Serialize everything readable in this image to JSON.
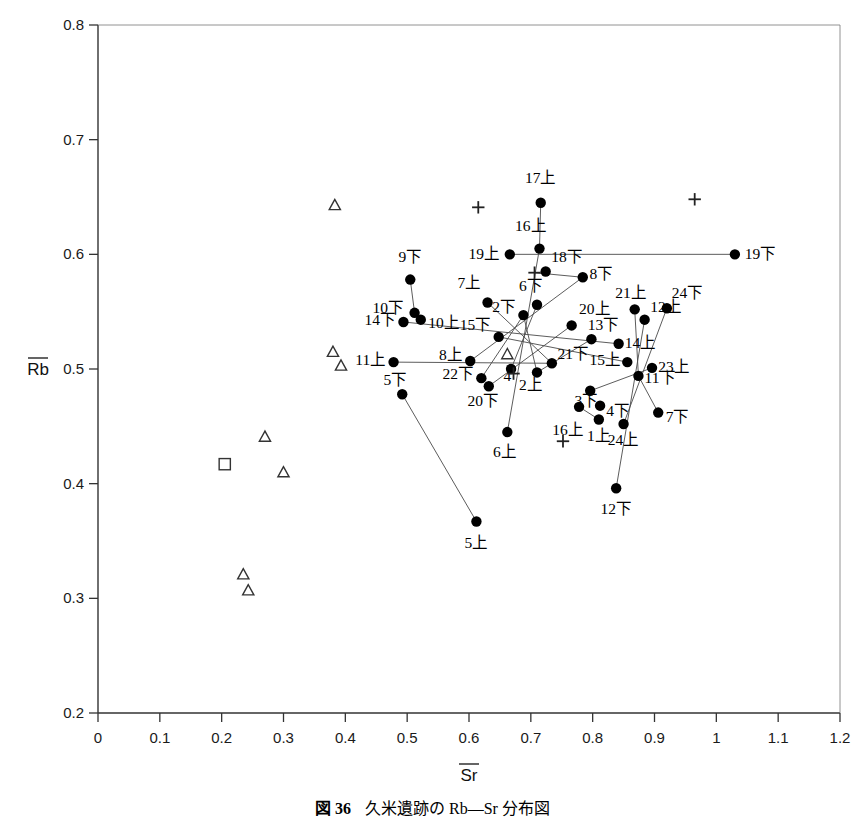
{
  "figure": {
    "caption_label": "図 36",
    "caption_text": "久米遺跡の Rb—Sr 分布図"
  },
  "chart_data": {
    "type": "scatter",
    "title": "",
    "xlabel": "Sr",
    "ylabel": "Rb",
    "xlabel_overline": true,
    "ylabel_overline": true,
    "xlim": [
      0,
      1.2
    ],
    "ylim": [
      0.2,
      0.8
    ],
    "xticks": [
      0,
      0.1,
      0.2,
      0.3,
      0.4,
      0.5,
      0.6,
      0.7,
      0.8,
      0.9,
      1,
      1.1,
      1.2
    ],
    "xticklabels": [
      "0",
      "0.1",
      "0.2",
      "0.3",
      "0.4",
      "0.5",
      "0.6",
      "0.7",
      "0.8",
      "0.9",
      "1",
      "1.1",
      "1.2"
    ],
    "yticks": [
      0.2,
      0.3,
      0.4,
      0.5,
      0.6,
      0.7,
      0.8
    ],
    "yticklabels": [
      "0.2",
      "0.3",
      "0.4",
      "0.5",
      "0.6",
      "0.7",
      "0.8"
    ],
    "grid": false,
    "legend": "none",
    "series": [
      {
        "name": "filled-circle-labeled",
        "marker": "circle",
        "color": "#000000",
        "points": [
          {
            "label": "17上",
            "x": 0.716,
            "y": 0.645,
            "lx": 0.716,
            "ly": 0.667,
            "anchor": "middle"
          },
          {
            "label": "16上",
            "x": 0.714,
            "y": 0.605,
            "lx": 0.7,
            "ly": 0.625,
            "anchor": "middle"
          },
          {
            "label": "19上",
            "x": 0.666,
            "y": 0.6,
            "lx": 0.65,
            "ly": 0.6,
            "anchor": "end"
          },
          {
            "label": "19下",
            "x": 1.03,
            "y": 0.6,
            "lx": 1.046,
            "ly": 0.6,
            "anchor": "start"
          },
          {
            "label": "18下",
            "x": 0.724,
            "y": 0.585,
            "lx": 0.733,
            "ly": 0.598,
            "anchor": "start"
          },
          {
            "label": "8下",
            "x": 0.784,
            "y": 0.58,
            "lx": 0.795,
            "ly": 0.583,
            "anchor": "start"
          },
          {
            "label": "9下",
            "x": 0.505,
            "y": 0.578,
            "lx": 0.505,
            "ly": 0.598,
            "anchor": "middle"
          },
          {
            "label": "7上",
            "x": 0.63,
            "y": 0.558,
            "lx": 0.62,
            "ly": 0.575,
            "anchor": "end"
          },
          {
            "label": "6下",
            "x": 0.71,
            "y": 0.556,
            "lx": 0.7,
            "ly": 0.572,
            "anchor": "middle"
          },
          {
            "label": "10下",
            "x": 0.512,
            "y": 0.549,
            "lx": 0.495,
            "ly": 0.553,
            "anchor": "end"
          },
          {
            "label": "10上",
            "x": 0.522,
            "y": 0.543,
            "lx": 0.534,
            "ly": 0.54,
            "anchor": "start"
          },
          {
            "label": "2下",
            "x": 0.688,
            "y": 0.547,
            "lx": 0.676,
            "ly": 0.554,
            "anchor": "end"
          },
          {
            "label": "21上",
            "x": 0.868,
            "y": 0.552,
            "lx": 0.862,
            "ly": 0.566,
            "anchor": "middle"
          },
          {
            "label": "12上",
            "x": 0.884,
            "y": 0.543,
            "lx": 0.893,
            "ly": 0.554,
            "anchor": "start"
          },
          {
            "label": "24下",
            "x": 0.92,
            "y": 0.553,
            "lx": 0.928,
            "ly": 0.566,
            "anchor": "start"
          },
          {
            "label": "14下",
            "x": 0.494,
            "y": 0.541,
            "lx": 0.482,
            "ly": 0.543,
            "anchor": "end"
          },
          {
            "label": "20上",
            "x": 0.766,
            "y": 0.538,
            "lx": 0.778,
            "ly": 0.552,
            "anchor": "start"
          },
          {
            "label": "15下",
            "x": 0.648,
            "y": 0.528,
            "lx": 0.636,
            "ly": 0.538,
            "anchor": "end"
          },
          {
            "label": "13下",
            "x": 0.798,
            "y": 0.526,
            "lx": 0.792,
            "ly": 0.538,
            "anchor": "start"
          },
          {
            "label": "14上",
            "x": 0.842,
            "y": 0.522,
            "lx": 0.852,
            "ly": 0.523,
            "anchor": "start"
          },
          {
            "label": "11上",
            "x": 0.478,
            "y": 0.506,
            "lx": 0.466,
            "ly": 0.508,
            "anchor": "end"
          },
          {
            "label": "8上",
            "x": 0.602,
            "y": 0.507,
            "lx": 0.59,
            "ly": 0.512,
            "anchor": "end"
          },
          {
            "label": "21下",
            "x": 0.734,
            "y": 0.505,
            "lx": 0.743,
            "ly": 0.513,
            "anchor": "start"
          },
          {
            "label": "15上",
            "x": 0.856,
            "y": 0.506,
            "lx": 0.846,
            "ly": 0.508,
            "anchor": "end"
          },
          {
            "label": "23上",
            "x": 0.896,
            "y": 0.501,
            "lx": 0.906,
            "ly": 0.502,
            "anchor": "start"
          },
          {
            "label": "11下",
            "x": 0.874,
            "y": 0.494,
            "lx": 0.884,
            "ly": 0.492,
            "anchor": "start"
          },
          {
            "label": "22下",
            "x": 0.62,
            "y": 0.492,
            "lx": 0.608,
            "ly": 0.496,
            "anchor": "end"
          },
          {
            "label": "4",
            "x": 0.668,
            "y": 0.5,
            "lx": 0.662,
            "ly": 0.494,
            "anchor": "middle"
          },
          {
            "label": "2上",
            "x": 0.71,
            "y": 0.497,
            "lx": 0.7,
            "ly": 0.486,
            "anchor": "middle"
          },
          {
            "label": "5下",
            "x": 0.492,
            "y": 0.478,
            "lx": 0.481,
            "ly": 0.49,
            "anchor": "middle"
          },
          {
            "label": "20下",
            "x": 0.632,
            "y": 0.485,
            "lx": 0.623,
            "ly": 0.472,
            "anchor": "middle"
          },
          {
            "label": "3下",
            "x": 0.796,
            "y": 0.481,
            "lx": 0.79,
            "ly": 0.472,
            "anchor": "middle"
          },
          {
            "label": "4下",
            "x": 0.812,
            "y": 0.468,
            "lx": 0.822,
            "ly": 0.463,
            "anchor": "start"
          },
          {
            "label": "24上",
            "x": 0.85,
            "y": 0.452,
            "lx": 0.85,
            "ly": 0.438,
            "anchor": "middle"
          },
          {
            "label": "7下",
            "x": 0.906,
            "y": 0.462,
            "lx": 0.918,
            "ly": 0.458,
            "anchor": "start"
          },
          {
            "label": "1上",
            "x": 0.81,
            "y": 0.456,
            "lx": 0.81,
            "ly": 0.442,
            "anchor": "middle"
          },
          {
            "label": "16上",
            "x": 0.778,
            "y": 0.467,
            "lx": 0.76,
            "ly": 0.447,
            "anchor": "middle"
          },
          {
            "label": "6上",
            "x": 0.662,
            "y": 0.445,
            "lx": 0.658,
            "ly": 0.428,
            "anchor": "middle"
          },
          {
            "label": "12下",
            "x": 0.838,
            "y": 0.396,
            "lx": 0.838,
            "ly": 0.378,
            "anchor": "middle"
          },
          {
            "label": "5上",
            "x": 0.612,
            "y": 0.367,
            "lx": 0.612,
            "ly": 0.348,
            "anchor": "middle"
          }
        ]
      },
      {
        "name": "open-triangle",
        "marker": "triangle",
        "color": "#333333",
        "points": [
          {
            "x": 0.383,
            "y": 0.643
          },
          {
            "x": 0.38,
            "y": 0.515
          },
          {
            "x": 0.393,
            "y": 0.503
          },
          {
            "x": 0.662,
            "y": 0.513
          },
          {
            "x": 0.27,
            "y": 0.441
          },
          {
            "x": 0.3,
            "y": 0.41
          },
          {
            "x": 0.235,
            "y": 0.321
          },
          {
            "x": 0.243,
            "y": 0.307
          }
        ]
      },
      {
        "name": "open-square",
        "marker": "square",
        "color": "#333333",
        "points": [
          {
            "x": 0.205,
            "y": 0.417
          }
        ]
      },
      {
        "name": "plus-marker",
        "marker": "plus",
        "color": "#222222",
        "points": [
          {
            "x": 0.615,
            "y": 0.641
          },
          {
            "x": 0.965,
            "y": 0.648
          },
          {
            "x": 0.706,
            "y": 0.584
          },
          {
            "x": 0.672,
            "y": 0.496
          },
          {
            "x": 0.752,
            "y": 0.437
          }
        ]
      }
    ],
    "connectors": [
      {
        "from": "19上",
        "to": "19下",
        "x1": 0.666,
        "y1": 0.6,
        "x2": 1.03,
        "y2": 0.6
      },
      {
        "from": "16上",
        "to": "6上",
        "x1": 0.714,
        "y1": 0.605,
        "x2": 0.662,
        "y2": 0.445
      },
      {
        "from": "18下",
        "to": "8下",
        "x1": 0.706,
        "y1": 0.584,
        "x2": 0.784,
        "y2": 0.58
      },
      {
        "from": "9下",
        "to": "10下",
        "x1": 0.505,
        "y1": 0.578,
        "x2": 0.512,
        "y2": 0.549
      },
      {
        "from": "10下",
        "to": "10上",
        "x1": 0.512,
        "y1": 0.549,
        "x2": 0.522,
        "y2": 0.543
      },
      {
        "from": "7上",
        "to": "21下",
        "x1": 0.63,
        "y1": 0.558,
        "x2": 0.734,
        "y2": 0.505
      },
      {
        "from": "14下",
        "to": "14上",
        "x1": 0.494,
        "y1": 0.541,
        "x2": 0.842,
        "y2": 0.522
      },
      {
        "from": "11上",
        "to": "21下",
        "x1": 0.478,
        "y1": 0.506,
        "x2": 0.734,
        "y2": 0.505
      },
      {
        "from": "5下",
        "to": "5上",
        "x1": 0.492,
        "y1": 0.478,
        "x2": 0.612,
        "y2": 0.367
      },
      {
        "from": "8上",
        "to": "8下",
        "x1": 0.602,
        "y1": 0.507,
        "x2": 0.784,
        "y2": 0.58
      },
      {
        "from": "22下",
        "to": "2下",
        "x1": 0.62,
        "y1": 0.492,
        "x2": 0.688,
        "y2": 0.547
      },
      {
        "from": "20上",
        "to": "20下",
        "x1": 0.766,
        "y1": 0.538,
        "x2": 0.632,
        "y2": 0.485
      },
      {
        "from": "15下",
        "to": "15上",
        "x1": 0.648,
        "y1": 0.528,
        "x2": 0.856,
        "y2": 0.506
      },
      {
        "from": "13下",
        "to": "2上",
        "x1": 0.798,
        "y1": 0.526,
        "x2": 0.71,
        "y2": 0.497
      },
      {
        "from": "21上",
        "to": "11下",
        "x1": 0.868,
        "y1": 0.552,
        "x2": 0.874,
        "y2": 0.494
      },
      {
        "from": "12上",
        "to": "12下",
        "x1": 0.884,
        "y1": 0.543,
        "x2": 0.838,
        "y2": 0.396
      },
      {
        "from": "24下",
        "to": "24上",
        "x1": 0.92,
        "y1": 0.553,
        "x2": 0.85,
        "y2": 0.452
      },
      {
        "from": "23上",
        "to": "3下",
        "x1": 0.896,
        "y1": 0.501,
        "x2": 0.796,
        "y2": 0.481
      },
      {
        "from": "11下",
        "to": "7下",
        "x1": 0.874,
        "y1": 0.494,
        "x2": 0.906,
        "y2": 0.462
      },
      {
        "from": "16上",
        "to": "1上",
        "x1": 0.778,
        "y1": 0.467,
        "x2": 0.81,
        "y2": 0.456
      },
      {
        "from": "6下",
        "to": "4",
        "x1": 0.71,
        "y1": 0.556,
        "x2": 0.668,
        "y2": 0.5
      },
      {
        "from": "2下",
        "to": "2上",
        "x1": 0.688,
        "y1": 0.547,
        "x2": 0.71,
        "y2": 0.497
      },
      {
        "from": "17上",
        "to": "16上",
        "x1": 0.716,
        "y1": 0.645,
        "x2": 0.714,
        "y2": 0.605
      }
    ]
  }
}
